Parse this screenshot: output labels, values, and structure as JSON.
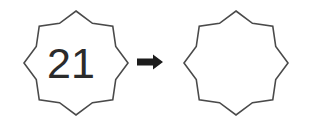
{
  "figure": {
    "background_color": "#ffffff",
    "stroke_color": "#4a4a4a",
    "fill_color": "#ffffff",
    "text_color": "#2b2b2b",
    "arrow_color": "#1c1c1c",
    "stroke_width": 1.6,
    "items": [
      {
        "name": "left-star",
        "kind": "octagram",
        "label": "21",
        "center_x": 76,
        "center_y": 63,
        "outer_radius": 52,
        "inner_radius": 43,
        "points": 8,
        "rotation_deg": 0,
        "label_x": 71,
        "label_y": 78,
        "label_font_size": 43
      },
      {
        "name": "arrow",
        "kind": "arrow-right",
        "x": 137,
        "y": 62,
        "length": 26,
        "shaft_height": 7,
        "head_width": 10,
        "head_height": 15
      },
      {
        "name": "right-star",
        "kind": "octagram",
        "label": "",
        "center_x": 236,
        "center_y": 63,
        "outer_radius": 52,
        "inner_radius": 43,
        "points": 8,
        "rotation_deg": 0,
        "label_x": 236,
        "label_y": 78,
        "label_font_size": 43
      }
    ]
  }
}
